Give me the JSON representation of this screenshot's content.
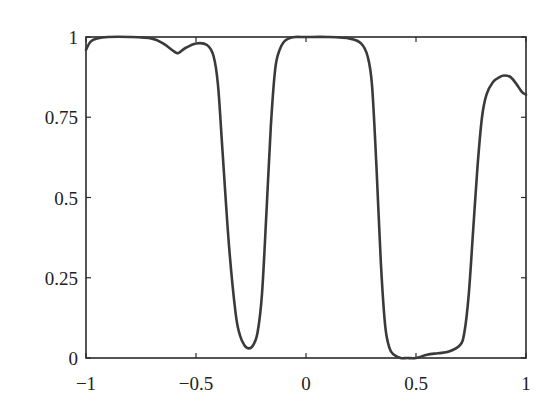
{
  "chart_data": {
    "type": "line",
    "title": "",
    "xlabel": "",
    "ylabel": "",
    "xlim": [
      -1,
      1
    ],
    "ylim": [
      0,
      1
    ],
    "grid": false,
    "legend": null,
    "xticks": [
      -1,
      -0.5,
      0,
      0.5,
      1
    ],
    "xtick_labels": [
      "−1",
      "−0.5",
      "0",
      "0.5",
      "1"
    ],
    "yticks": [
      0,
      0.25,
      0.5,
      0.75,
      1
    ],
    "ytick_labels": [
      "0",
      "0.25",
      "0.5",
      "0.75",
      "1"
    ],
    "series": [
      {
        "name": "curve",
        "color": "#3a3a3a",
        "x": [
          -1.0,
          -0.98,
          -0.95,
          -0.9,
          -0.8,
          -0.7,
          -0.65,
          -0.6,
          -0.58,
          -0.55,
          -0.5,
          -0.45,
          -0.42,
          -0.4,
          -0.38,
          -0.35,
          -0.32,
          -0.3,
          -0.28,
          -0.26,
          -0.24,
          -0.22,
          -0.2,
          -0.18,
          -0.16,
          -0.14,
          -0.12,
          -0.1,
          -0.08,
          -0.05,
          0.0,
          0.1,
          0.2,
          0.25,
          0.28,
          0.3,
          0.32,
          0.34,
          0.36,
          0.38,
          0.4,
          0.43,
          0.46,
          0.5,
          0.55,
          0.6,
          0.65,
          0.7,
          0.72,
          0.74,
          0.76,
          0.78,
          0.8,
          0.82,
          0.85,
          0.88,
          0.9,
          0.93,
          0.96,
          0.98,
          1.0
        ],
        "y": [
          0.96,
          0.985,
          0.995,
          1.0,
          1.0,
          0.995,
          0.98,
          0.955,
          0.95,
          0.965,
          0.98,
          0.975,
          0.94,
          0.85,
          0.65,
          0.35,
          0.14,
          0.07,
          0.04,
          0.03,
          0.04,
          0.08,
          0.2,
          0.45,
          0.72,
          0.9,
          0.96,
          0.985,
          0.995,
          1.0,
          1.0,
          1.0,
          0.995,
          0.98,
          0.94,
          0.85,
          0.6,
          0.3,
          0.1,
          0.03,
          0.01,
          0.0,
          0.0,
          0.0,
          0.01,
          0.015,
          0.02,
          0.04,
          0.08,
          0.2,
          0.4,
          0.6,
          0.75,
          0.82,
          0.86,
          0.875,
          0.88,
          0.875,
          0.85,
          0.83,
          0.82
        ]
      }
    ]
  }
}
